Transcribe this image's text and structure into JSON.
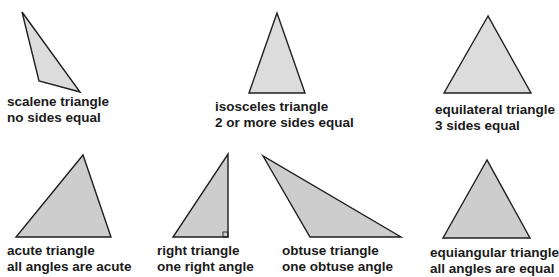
{
  "diagram": {
    "triangles": [
      {
        "id": "scalene",
        "name": "scalene triangle",
        "property": "no sides equal"
      },
      {
        "id": "isosceles",
        "name": "isosceles triangle",
        "property": "2 or more sides equal"
      },
      {
        "id": "equilateral",
        "name": "equilateral triangle",
        "property": "3 sides equal"
      },
      {
        "id": "acute",
        "name": "acute triangle",
        "property": "all angles are acute"
      },
      {
        "id": "right",
        "name": "right triangle",
        "property": "one right angle"
      },
      {
        "id": "obtuse",
        "name": "obtuse triangle",
        "property": "one obtuse angle"
      },
      {
        "id": "equiangular",
        "name": "equiangular triangle",
        "property": "all angles are equal"
      }
    ],
    "colors": {
      "fill_top": "#dcdcdc",
      "fill_bottom": "#cdcdcd",
      "stroke": "#1e1e1e",
      "text": "#1a1a1a"
    }
  }
}
